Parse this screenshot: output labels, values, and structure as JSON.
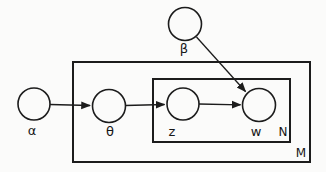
{
  "diagram": {
    "kind": "graphical-model-plate-notation",
    "nodes": [
      {
        "id": "alpha",
        "label": "α",
        "shaded": false
      },
      {
        "id": "beta",
        "label": "β",
        "shaded": false
      },
      {
        "id": "theta",
        "label": "θ",
        "shaded": false
      },
      {
        "id": "z",
        "label": "z",
        "shaded": false
      },
      {
        "id": "w",
        "label": "w",
        "shaded": true
      }
    ],
    "plates": [
      {
        "id": "inner",
        "label": "N"
      },
      {
        "id": "outer",
        "label": "M"
      }
    ],
    "edges": [
      {
        "from": "alpha",
        "to": "theta"
      },
      {
        "from": "theta",
        "to": "z"
      },
      {
        "from": "z",
        "to": "w"
      },
      {
        "from": "beta",
        "to": "w"
      }
    ],
    "colors": {
      "stroke": "#1c1c1c",
      "shaded_fill": "#8c8c8c",
      "background": "#fbfbfa"
    }
  }
}
